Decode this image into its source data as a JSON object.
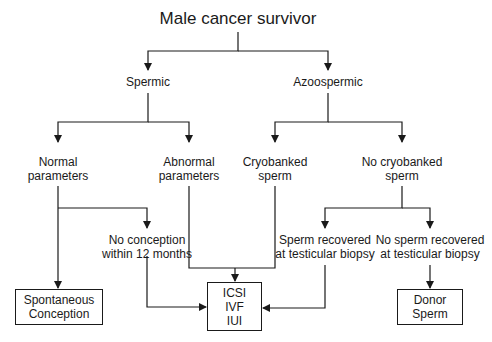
{
  "diagram": {
    "title": "Male cancer survivor",
    "level1": {
      "left": "Spermic",
      "right": "Azoospermic"
    },
    "level2": {
      "normal": [
        "Normal",
        "parameters"
      ],
      "abnormal": [
        "Abnormal",
        "parameters"
      ],
      "cryobanked": [
        "Cryobanked",
        "sperm"
      ],
      "no_cryobanked": [
        "No cryobanked",
        "sperm"
      ]
    },
    "level3": {
      "no_conception": [
        "No conception",
        "within 12 months"
      ],
      "sperm_recovered": [
        "Sperm recovered",
        "at testicular biopsy"
      ],
      "no_sperm_recovered": [
        "No sperm recovered",
        "at testicular biopsy"
      ]
    },
    "outcomes": {
      "spontaneous": [
        "Spontaneous",
        "Conception"
      ],
      "art": [
        "ICSI",
        "IVF",
        "IUI"
      ],
      "donor": [
        "Donor",
        "Sperm"
      ]
    },
    "line_color": "#1a1a1a"
  }
}
